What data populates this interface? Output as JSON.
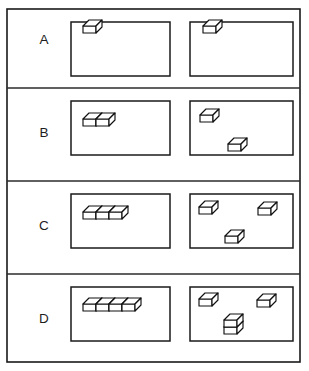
{
  "figure": {
    "background_color": "#ffffff",
    "line_color": "#1a1a1a",
    "cube_fill_color": "#ffffff",
    "cube_line_color": "#111111",
    "canvas": {
      "width": 309,
      "height": 371
    },
    "outer_frame": {
      "x": 7,
      "y": 9,
      "width": 293,
      "height": 353
    },
    "row_dividers_y": [
      88,
      181,
      274
    ],
    "panel_left_geometry": {
      "x": 71,
      "y_offset": 13,
      "width": 99,
      "height": 54
    },
    "panel_right_geometry": {
      "x": 190,
      "y_offset": 13,
      "width": 103,
      "height": 54
    },
    "cube_size": {
      "front_width": 13,
      "front_height": 7,
      "depth_x": 6,
      "depth_y": 6
    }
  },
  "rows": [
    {
      "id": "row-a",
      "label": "A",
      "label_x": 44,
      "label_y": 40,
      "row_top": 9,
      "row_bottom": 88,
      "count": 1,
      "left_panel": {
        "name": "joined-blocks-panel",
        "arrangement": "joined-row",
        "block_count": 1,
        "origin": {
          "x": 83,
          "y": 33
        },
        "stacks": [
          {
            "x": 83,
            "y": 33,
            "height": 1
          }
        ]
      },
      "right_panel": {
        "name": "separated-blocks-panel",
        "arrangement": "scattered",
        "block_count": 1,
        "blocks": [
          {
            "x": 203,
            "y": 33,
            "height": 1
          }
        ]
      }
    },
    {
      "id": "row-b",
      "label": "B",
      "label_x": 44,
      "label_y": 133,
      "row_top": 88,
      "row_bottom": 181,
      "count": 2,
      "left_panel": {
        "name": "joined-blocks-panel",
        "arrangement": "joined-row",
        "block_count": 2,
        "origin": {
          "x": 83,
          "y": 126
        },
        "stacks": [
          {
            "x": 83,
            "y": 126,
            "height": 1
          },
          {
            "x": 96,
            "y": 126,
            "height": 1
          }
        ]
      },
      "right_panel": {
        "name": "separated-blocks-panel",
        "arrangement": "scattered",
        "block_count": 2,
        "blocks": [
          {
            "x": 200,
            "y": 122,
            "height": 1
          },
          {
            "x": 228,
            "y": 151,
            "height": 1
          }
        ]
      }
    },
    {
      "id": "row-c",
      "label": "C",
      "label_x": 44,
      "label_y": 226,
      "row_top": 181,
      "row_bottom": 274,
      "count": 3,
      "left_panel": {
        "name": "joined-blocks-panel",
        "arrangement": "joined-row",
        "block_count": 3,
        "origin": {
          "x": 83,
          "y": 219
        },
        "stacks": [
          {
            "x": 83,
            "y": 219,
            "height": 1
          },
          {
            "x": 96,
            "y": 219,
            "height": 1
          },
          {
            "x": 109,
            "y": 219,
            "height": 1
          }
        ]
      },
      "right_panel": {
        "name": "separated-blocks-panel",
        "arrangement": "scattered",
        "block_count": 3,
        "blocks": [
          {
            "x": 199,
            "y": 214,
            "height": 1
          },
          {
            "x": 258,
            "y": 215,
            "height": 1
          },
          {
            "x": 225,
            "y": 243,
            "height": 1
          }
        ]
      }
    },
    {
      "id": "row-d",
      "label": "D",
      "label_x": 44,
      "label_y": 319,
      "row_top": 274,
      "row_bottom": 362,
      "count": 4,
      "left_panel": {
        "name": "joined-blocks-panel",
        "arrangement": "joined-row",
        "block_count": 4,
        "origin": {
          "x": 83,
          "y": 311
        },
        "stacks": [
          {
            "x": 83,
            "y": 311,
            "height": 1
          },
          {
            "x": 96,
            "y": 311,
            "height": 1
          },
          {
            "x": 109,
            "y": 311,
            "height": 1
          },
          {
            "x": 122,
            "y": 311,
            "height": 1
          }
        ]
      },
      "right_panel": {
        "name": "separated-blocks-panel",
        "arrangement": "scattered-with-stack",
        "block_count": 4,
        "blocks": [
          {
            "x": 199,
            "y": 306,
            "height": 1
          },
          {
            "x": 257,
            "y": 307,
            "height": 1
          },
          {
            "x": 224,
            "y": 334,
            "height": 2
          }
        ]
      }
    }
  ],
  "chart_data": {
    "type": "table",
    "categories": [
      "A",
      "B",
      "C",
      "D"
    ],
    "series": [
      {
        "name": "Joined blocks (left panel)",
        "values": [
          1,
          2,
          3,
          4
        ]
      },
      {
        "name": "Separated blocks (right panel)",
        "values": [
          1,
          2,
          3,
          4
        ]
      }
    ],
    "annotations": [
      "Row A: 1 joined block vs 1 separate block",
      "Row B: 2 joined blocks vs 2 separate blocks",
      "Row C: 3 joined blocks vs 3 separate blocks",
      "Row D: 4 joined blocks vs 2 separate blocks plus a stack of 2"
    ],
    "xlabel": "Row",
    "ylabel": "Number of blocks",
    "ylim": [
      0,
      4
    ],
    "grid": false,
    "legend": "none"
  }
}
